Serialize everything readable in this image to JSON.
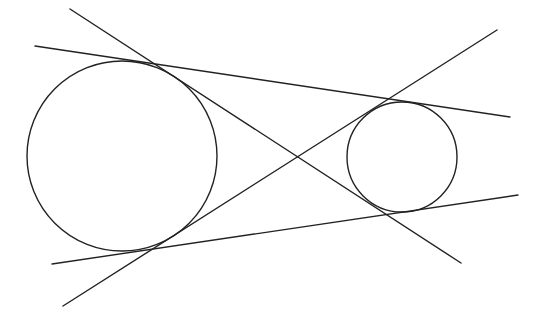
{
  "diagram": {
    "title": "",
    "stroke_color": "#222222",
    "background": "#ffffff",
    "circles": [
      {
        "name": "large-circle",
        "cx": 122,
        "cy": 156,
        "r": 95
      },
      {
        "name": "small-circle",
        "cx": 402,
        "cy": 157,
        "r": 55
      }
    ],
    "lines": [
      {
        "name": "external-tangent-top",
        "x1": 35,
        "y1": 46,
        "x2": 510,
        "y2": 117
      },
      {
        "name": "external-tangent-bottom",
        "x1": 52,
        "y1": 264,
        "x2": 518,
        "y2": 195
      },
      {
        "name": "internal-tangent-descending",
        "x1": 70,
        "y1": 9,
        "x2": 461,
        "y2": 263
      },
      {
        "name": "internal-tangent-ascending",
        "x1": 63,
        "y1": 306,
        "x2": 497,
        "y2": 30
      }
    ]
  }
}
